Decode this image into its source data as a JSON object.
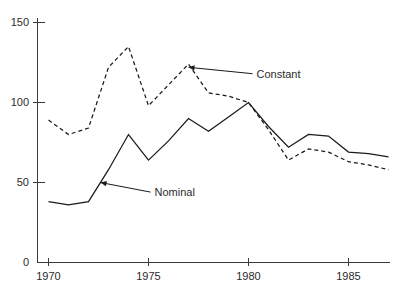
{
  "chart_data": {
    "type": "line",
    "title": "",
    "xlabel": "",
    "ylabel": "",
    "xlim": [
      1969,
      1988
    ],
    "ylim": [
      0,
      158
    ],
    "grid": false,
    "legend_position": "inline-annotations",
    "x": [
      1970,
      1971,
      1972,
      1973,
      1974,
      1975,
      1976,
      1977,
      1978,
      1979,
      1980,
      1981,
      1982,
      1983,
      1984,
      1985,
      1986,
      1987
    ],
    "xticks": [
      1970,
      1975,
      1980,
      1985
    ],
    "xticklabels": [
      "1970",
      "1975",
      "1980",
      "1985"
    ],
    "yticks": [
      0,
      50,
      100,
      150
    ],
    "yticklabels": [
      "0",
      "50",
      "100",
      "150"
    ],
    "series": [
      {
        "name": "Nominal",
        "style": "solid",
        "color": "#1a1a1a",
        "values": [
          38,
          36,
          38,
          58,
          80,
          64,
          76,
          90,
          82,
          91,
          100,
          85,
          72,
          80,
          79,
          69,
          68,
          66
        ]
      },
      {
        "name": "Constant",
        "style": "dashed",
        "color": "#1a1a1a",
        "values": [
          89,
          80,
          84,
          122,
          135,
          98,
          111,
          124,
          106,
          104,
          100,
          83,
          64,
          71,
          69,
          63,
          61,
          58
        ]
      }
    ],
    "annotations": [
      {
        "text": "Constant",
        "target_x": 1977,
        "target_y": 122,
        "label_x": 1980.2,
        "label_y": 118
      },
      {
        "text": "Nominal",
        "target_x": 1972.6,
        "target_y": 50,
        "label_x": 1975.1,
        "label_y": 44
      }
    ]
  },
  "axis": {
    "ytick_0": "0",
    "ytick_50": "50",
    "ytick_100": "100",
    "ytick_150": "150",
    "xtick_1970": "1970",
    "xtick_1975": "1975",
    "xtick_1980": "1980",
    "xtick_1985": "1985"
  },
  "labels": {
    "constant": "Constant",
    "nominal": "Nominal"
  }
}
